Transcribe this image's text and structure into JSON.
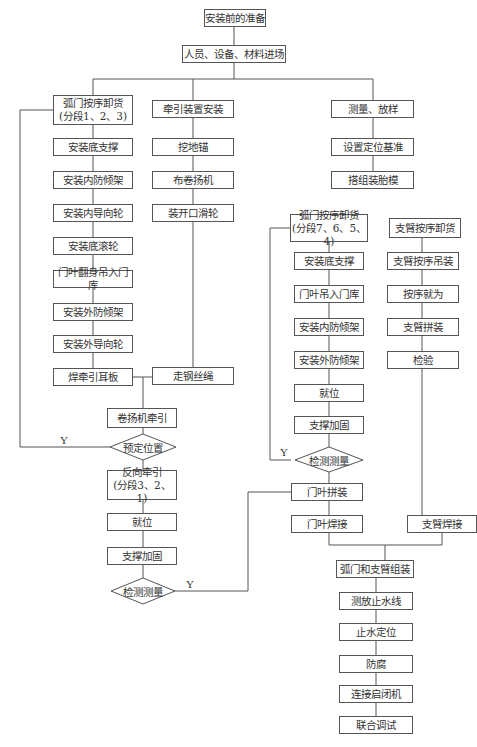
{
  "nodes": {
    "prep": "安装前的准备",
    "entry": "人员、设备、材料进场",
    "unload1": "弧门按序卸货\n(分段1、2、3)",
    "traction_setup": "牵引装置安装",
    "survey": "测量、放样",
    "l_base_support": "安装底支撑",
    "l_inner_frame": "安装内防倾架",
    "l_inner_guide": "安装内导向轮",
    "l_bottom_roller": "安装底滚轮",
    "l_leaf_flip": "门叶翻身吊入门库",
    "l_outer_frame": "安装外防倾架",
    "l_outer_guide": "安装外导向轮",
    "l_weld_plate": "焊牵引耳板",
    "t_anchor": "挖地锚",
    "t_winch": "布卷扬机",
    "t_pulley": "装开口滑轮",
    "t_wire": "走钢丝绳",
    "winch_pull": "卷扬机牵引",
    "d_preset": "预定位置",
    "reverse_pull": "反向牵引\n(分段3、2、1)",
    "l_in_place": "就位",
    "l_reinforce": "支撑加固",
    "d_inspect1": "检测测量",
    "s_datum": "设置定位基准",
    "s_jig": "搭组装胎模",
    "unload2": "弧门按序卸货\n(分段7、6、5、4)",
    "r_base_support": "安装底支撑",
    "r_leaf_in": "门叶吊入门库",
    "r_inner_frame": "安装内防倾架",
    "r_outer_frame": "安装外防倾架",
    "r_in_place": "就位",
    "r_reinforce": "支撑加固",
    "d_inspect2": "检测测量",
    "leaf_assemble": "门叶拼装",
    "leaf_weld": "门叶焊接",
    "a_unload": "支臂按序卸货",
    "a_hoist": "支臂按序吊装",
    "a_position": "按序就为",
    "a_assemble": "支臂拼装",
    "a_check": "检验",
    "a_weld": "支臂焊接",
    "gate_arm_assembly": "弧门和支臂组装",
    "waterstop_line": "测放止水线",
    "waterstop_pos": "止水定位",
    "anticorrosion": "防腐",
    "hoist_connect": "连接启闭机",
    "joint_test": "联合调试"
  },
  "labels": {
    "yes1": "Y",
    "yes2": "Y",
    "yes3": "Y"
  },
  "colors": {
    "line": "#555555",
    "text": "#333333",
    "background": "#ffffff"
  }
}
